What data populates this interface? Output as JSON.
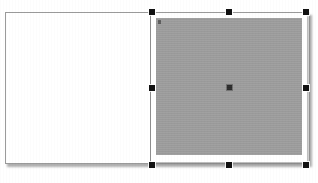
{
  "canvas": {
    "name": "editor-canvas",
    "background_color": "#ffffff",
    "width": 318,
    "height": 183
  },
  "page_sheet": {
    "name": "page-sheet",
    "fill_color": "#ffffff",
    "border_color": "#9a9a9a",
    "shadow": true,
    "label": ""
  },
  "divider": {
    "name": "column-divider",
    "color": "#8e8e8e",
    "label": ""
  },
  "selected_object": {
    "name": "image-placeholder",
    "frame_color": "#ffffff",
    "fill_color": "#9e9e9e",
    "selected": true,
    "label": "",
    "corner_mark_color": "#5d5d5d",
    "center_marker": {
      "name": "center-anchor",
      "color": "#2b2b2b",
      "label": ""
    }
  },
  "selection_handles": {
    "color": "#111111",
    "count": 8,
    "items": [
      {
        "id": "nw",
        "position": "top-left",
        "label": ""
      },
      {
        "id": "n",
        "position": "top-center",
        "label": ""
      },
      {
        "id": "ne",
        "position": "top-right",
        "label": ""
      },
      {
        "id": "w",
        "position": "middle-left",
        "label": ""
      },
      {
        "id": "e",
        "position": "middle-right",
        "label": ""
      },
      {
        "id": "sw",
        "position": "bottom-left",
        "label": ""
      },
      {
        "id": "s",
        "position": "bottom-center",
        "label": ""
      },
      {
        "id": "se",
        "position": "bottom-right",
        "label": ""
      }
    ]
  }
}
